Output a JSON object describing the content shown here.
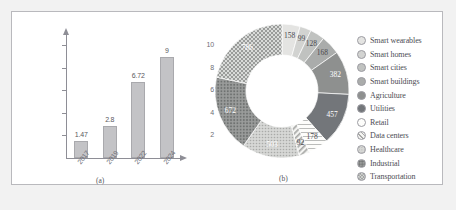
{
  "figure": {
    "background": "#f2f2f2",
    "panel_background": "#ffffff",
    "border_color": "#b9b9bd"
  },
  "panel_a": {
    "caption": "(a)",
    "chart_data": {
      "type": "bar",
      "title": "",
      "xlabel": "",
      "ylabel": "",
      "categories": [
        "2017",
        "2019",
        "2022",
        "2024"
      ],
      "values": [
        1.47,
        2.8,
        6.72,
        9
      ],
      "value_labels": [
        "1.47",
        "2.8",
        "6.72",
        "9"
      ],
      "ylim": [
        0,
        11
      ],
      "yticks": [
        2,
        4,
        6,
        8,
        10
      ],
      "ytick_labels": [
        "2",
        "4",
        "6",
        "8",
        "10"
      ],
      "grid": false,
      "legend": "none",
      "bar_color": "#c3c3c6",
      "bar_edge_color": "#a9a9ad",
      "axis_color": "#8e8e96"
    }
  },
  "panel_b": {
    "caption": "(b)",
    "chart_data": {
      "type": "pie",
      "variant": "donut",
      "title": "",
      "legend_position": "right",
      "categories": [
        "Smart wearables",
        "Smart homes",
        "Smart cities",
        "Smart buildings",
        "Agriculture",
        "Utilities",
        "Retail",
        "Data centers",
        "Healthcare",
        "Industrial",
        "Transportation"
      ],
      "values": [
        158,
        99,
        128,
        168,
        382,
        457,
        178,
        92,
        503,
        672,
        786
      ],
      "value_labels": [
        "158",
        "99",
        "128",
        "168",
        "382",
        "457",
        "178",
        "92",
        "503",
        "672",
        "786"
      ],
      "colors": [
        "#e4e4e2",
        "#d2d3d1",
        "#c0c2c0",
        "#aaacab",
        "#8e908f",
        "#73767a",
        "#fbfbf9",
        "#e8e8e6",
        "#c9cac8",
        "#9a9c9b",
        "#b9bbb9"
      ],
      "patterns": [
        "solid",
        "solid",
        "solid",
        "solid",
        "solid",
        "solid",
        "outline",
        "diagonal-stripes",
        "fine-dots",
        "dots",
        "checker"
      ]
    }
  },
  "legend": {
    "items": [
      {
        "label": "Smart wearables",
        "color": "#e4e4e2",
        "pattern": "solid"
      },
      {
        "label": "Smart homes",
        "color": "#d2d3d1",
        "pattern": "solid"
      },
      {
        "label": "Smart cities",
        "color": "#c0c2c0",
        "pattern": "solid"
      },
      {
        "label": "Smart buildings",
        "color": "#aaacab",
        "pattern": "solid"
      },
      {
        "label": "Agriculture",
        "color": "#8e908f",
        "pattern": "solid"
      },
      {
        "label": "Utilities",
        "color": "#73767a",
        "pattern": "solid"
      },
      {
        "label": "Retail",
        "color": "#fbfbf9",
        "pattern": "outline"
      },
      {
        "label": "Data centers",
        "color": "#e8e8e6",
        "pattern": "diagonal-stripes"
      },
      {
        "label": "Healthcare",
        "color": "#c9cac8",
        "pattern": "fine-dots"
      },
      {
        "label": "Industrial",
        "color": "#9a9c9b",
        "pattern": "dots"
      },
      {
        "label": "Transportation",
        "color": "#b9bbb9",
        "pattern": "checker"
      }
    ]
  }
}
